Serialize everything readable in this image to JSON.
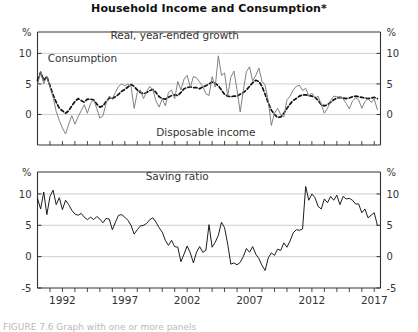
{
  "figure": {
    "title": "Household Income and Consumption*",
    "caption": "FIGURE 7.6 Graph with one or more panels"
  },
  "chart_data": [
    {
      "type": "line",
      "panel": "upper",
      "title": "Real, year-ended growth",
      "xlabel": "",
      "ylabel": "%",
      "ylabel_right": "%",
      "ylim": [
        -5,
        13.5
      ],
      "yticks": [
        0,
        5,
        10
      ],
      "ytick_labels": [
        "0",
        "5",
        "10"
      ],
      "xlim": [
        1990.0,
        2017.5
      ],
      "xticks": [
        1992,
        1997,
        2002,
        2007,
        2012,
        2017
      ],
      "xtick_labels": [
        "1992",
        "1997",
        "2002",
        "2007",
        "2012",
        "2017"
      ],
      "grid": true,
      "legend": "inline-annotations",
      "annotations": [
        {
          "text": "Real, year-ended growth",
          "x": 2001.0,
          "y": 12.3
        },
        {
          "text": "Consumption",
          "x": 1993.6,
          "y": 8.6
        },
        {
          "text": "Disposable income",
          "x": 2003.5,
          "y": -3.6
        }
      ],
      "series": [
        {
          "name": "Consumption",
          "style": "dashed",
          "color": "#111111",
          "x": [
            1990.0,
            1990.25,
            1990.5,
            1990.75,
            1991.0,
            1991.25,
            1991.5,
            1991.75,
            1992.0,
            1992.25,
            1992.5,
            1992.75,
            1993.0,
            1993.25,
            1993.5,
            1993.75,
            1994.0,
            1994.25,
            1994.5,
            1994.75,
            1995.0,
            1995.25,
            1995.5,
            1995.75,
            1996.0,
            1996.25,
            1996.5,
            1996.75,
            1997.0,
            1997.25,
            1997.5,
            1997.75,
            1998.0,
            1998.25,
            1998.5,
            1998.75,
            1999.0,
            1999.25,
            1999.5,
            1999.75,
            2000.0,
            2000.25,
            2000.5,
            2000.75,
            2001.0,
            2001.25,
            2001.5,
            2001.75,
            2002.0,
            2002.25,
            2002.5,
            2002.75,
            2003.0,
            2003.25,
            2003.5,
            2003.75,
            2004.0,
            2004.25,
            2004.5,
            2004.75,
            2005.0,
            2005.25,
            2005.5,
            2005.75,
            2006.0,
            2006.25,
            2006.5,
            2006.75,
            2007.0,
            2007.25,
            2007.5,
            2007.75,
            2008.0,
            2008.25,
            2008.5,
            2008.75,
            2009.0,
            2009.25,
            2009.5,
            2009.75,
            2010.0,
            2010.25,
            2010.5,
            2010.75,
            2011.0,
            2011.25,
            2011.5,
            2011.75,
            2012.0,
            2012.25,
            2012.5,
            2012.75,
            2013.0,
            2013.25,
            2013.5,
            2013.75,
            2014.0,
            2014.25,
            2014.5,
            2014.75,
            2015.0,
            2015.25,
            2015.5,
            2015.75,
            2016.0,
            2016.25,
            2016.5,
            2016.75,
            2017.0,
            2017.25
          ],
          "y": [
            5.6,
            6.9,
            5.6,
            6.2,
            4.7,
            3.2,
            2.0,
            1.0,
            0.6,
            0.2,
            0.6,
            1.4,
            2.1,
            2.6,
            2.3,
            2.0,
            2.5,
            2.5,
            2.4,
            1.7,
            1.2,
            1.4,
            2.1,
            2.7,
            2.6,
            2.9,
            3.3,
            3.8,
            4.1,
            4.5,
            4.9,
            4.6,
            4.0,
            3.6,
            3.4,
            3.6,
            3.9,
            4.1,
            3.6,
            2.9,
            2.6,
            2.5,
            2.8,
            3.1,
            3.2,
            3.1,
            3.6,
            4.2,
            4.4,
            4.5,
            4.4,
            4.4,
            4.2,
            4.5,
            4.7,
            5.0,
            5.3,
            5.1,
            4.7,
            4.0,
            3.3,
            3.0,
            2.9,
            3.0,
            3.0,
            3.3,
            3.6,
            4.0,
            4.6,
            5.2,
            5.6,
            5.4,
            4.6,
            3.3,
            1.9,
            0.7,
            0.0,
            -0.5,
            -0.4,
            0.2,
            1.0,
            1.7,
            2.3,
            2.6,
            3.0,
            3.2,
            3.2,
            3.1,
            3.0,
            2.8,
            2.3,
            1.6,
            1.4,
            1.6,
            2.0,
            2.4,
            2.7,
            2.8,
            2.7,
            2.6,
            2.7,
            2.9,
            3.0,
            2.9,
            2.8,
            2.7,
            2.6,
            2.7,
            2.8,
            2.6
          ]
        },
        {
          "name": "Disposable income",
          "style": "solid",
          "color": "#7a7a7a",
          "x": [
            1990.0,
            1990.25,
            1990.5,
            1990.75,
            1991.0,
            1991.25,
            1991.5,
            1991.75,
            1992.0,
            1992.25,
            1992.5,
            1992.75,
            1993.0,
            1993.25,
            1993.5,
            1993.75,
            1994.0,
            1994.25,
            1994.5,
            1994.75,
            1995.0,
            1995.25,
            1995.5,
            1995.75,
            1996.0,
            1996.25,
            1996.5,
            1996.75,
            1997.0,
            1997.25,
            1997.5,
            1997.75,
            1998.0,
            1998.25,
            1998.5,
            1998.75,
            1999.0,
            1999.25,
            1999.5,
            1999.75,
            2000.0,
            2000.25,
            2000.5,
            2000.75,
            2001.0,
            2001.25,
            2001.5,
            2001.75,
            2002.0,
            2002.25,
            2002.5,
            2002.75,
            2003.0,
            2003.25,
            2003.5,
            2003.75,
            2004.0,
            2004.25,
            2004.5,
            2004.75,
            2005.0,
            2005.25,
            2005.5,
            2005.75,
            2006.0,
            2006.25,
            2006.5,
            2006.75,
            2007.0,
            2007.25,
            2007.5,
            2007.75,
            2008.0,
            2008.25,
            2008.5,
            2008.75,
            2009.0,
            2009.25,
            2009.5,
            2009.75,
            2010.0,
            2010.25,
            2010.5,
            2010.75,
            2011.0,
            2011.25,
            2011.5,
            2011.75,
            2012.0,
            2012.25,
            2012.5,
            2012.75,
            2013.0,
            2013.25,
            2013.5,
            2013.75,
            2014.0,
            2014.25,
            2014.5,
            2014.75,
            2015.0,
            2015.25,
            2015.5,
            2015.75,
            2016.0,
            2016.25,
            2016.5,
            2016.75,
            2017.0,
            2017.25
          ],
          "y": [
            4.8,
            7.1,
            5.0,
            6.3,
            4.4,
            2.8,
            0.5,
            -1.0,
            -2.2,
            -3.2,
            -1.6,
            -0.2,
            -1.6,
            -0.4,
            0.6,
            1.6,
            0.2,
            1.8,
            2.4,
            1.0,
            -0.6,
            -0.2,
            1.8,
            3.0,
            2.6,
            3.6,
            4.6,
            5.0,
            4.7,
            5.0,
            4.6,
            1.0,
            3.6,
            4.0,
            2.6,
            3.8,
            4.6,
            4.0,
            2.2,
            1.2,
            2.6,
            1.4,
            3.6,
            4.0,
            2.6,
            5.4,
            4.0,
            5.8,
            6.4,
            4.4,
            6.2,
            6.0,
            5.3,
            4.6,
            3.4,
            3.1,
            6.2,
            4.5,
            9.6,
            6.4,
            6.8,
            3.0,
            6.1,
            7.1,
            4.0,
            0.4,
            3.9,
            7.0,
            7.8,
            5.5,
            6.4,
            7.6,
            5.4,
            4.8,
            2.2,
            -1.8,
            0.2,
            1.0,
            0.0,
            -0.4,
            2.4,
            3.0,
            4.0,
            4.6,
            4.8,
            3.9,
            4.3,
            3.0,
            3.5,
            2.6,
            3.0,
            1.6,
            0.2,
            1.0,
            2.3,
            3.0,
            2.9,
            2.8,
            2.6,
            1.8,
            0.9,
            2.2,
            2.7,
            2.4,
            1.0,
            2.1,
            2.6,
            2.0,
            2.5,
            0.8
          ]
        }
      ]
    },
    {
      "type": "line",
      "panel": "lower",
      "title": "Saving ratio",
      "xlabel": "",
      "ylabel": "%",
      "ylabel_right": "%",
      "ylim": [
        -5,
        13.5
      ],
      "yticks": [
        -5,
        0,
        5,
        10
      ],
      "ytick_labels": [
        "-5",
        "0",
        "5",
        "10"
      ],
      "xlim": [
        1990.0,
        2017.5
      ],
      "xticks": [
        1992,
        1997,
        2002,
        2007,
        2012,
        2017
      ],
      "xtick_labels": [
        "1992",
        "1997",
        "2002",
        "2007",
        "2012",
        "2017"
      ],
      "grid": true,
      "annotations": [
        {
          "text": "Saving ratio",
          "x": 2001.2,
          "y": 12.3
        }
      ],
      "series": [
        {
          "name": "Saving ratio",
          "style": "solid",
          "color": "#111111",
          "x": [
            1990.0,
            1990.25,
            1990.5,
            1990.75,
            1991.0,
            1991.25,
            1991.5,
            1991.75,
            1992.0,
            1992.25,
            1992.5,
            1992.75,
            1993.0,
            1993.25,
            1993.5,
            1993.75,
            1994.0,
            1994.25,
            1994.5,
            1994.75,
            1995.0,
            1995.25,
            1995.5,
            1995.75,
            1996.0,
            1996.25,
            1996.5,
            1996.75,
            1997.0,
            1997.25,
            1997.5,
            1997.75,
            1998.0,
            1998.25,
            1998.5,
            1998.75,
            1999.0,
            1999.25,
            1999.5,
            1999.75,
            2000.0,
            2000.25,
            2000.5,
            2000.75,
            2001.0,
            2001.25,
            2001.5,
            2001.75,
            2002.0,
            2002.25,
            2002.5,
            2002.75,
            2003.0,
            2003.25,
            2003.5,
            2003.75,
            2004.0,
            2004.25,
            2004.5,
            2004.75,
            2005.0,
            2005.25,
            2005.5,
            2005.75,
            2006.0,
            2006.25,
            2006.5,
            2006.75,
            2007.0,
            2007.25,
            2007.5,
            2007.75,
            2008.0,
            2008.25,
            2008.5,
            2008.75,
            2009.0,
            2009.25,
            2009.5,
            2009.75,
            2010.0,
            2010.25,
            2010.5,
            2010.75,
            2011.0,
            2011.25,
            2011.5,
            2011.75,
            2012.0,
            2012.25,
            2012.5,
            2012.75,
            2013.0,
            2013.25,
            2013.5,
            2013.75,
            2014.0,
            2014.25,
            2014.5,
            2014.75,
            2015.0,
            2015.25,
            2015.5,
            2015.75,
            2016.0,
            2016.25,
            2016.5,
            2016.75,
            2017.0,
            2017.25
          ],
          "y": [
            9.3,
            7.6,
            10.3,
            6.7,
            9.6,
            10.6,
            8.3,
            9.4,
            7.5,
            9.0,
            8.3,
            7.4,
            6.8,
            6.6,
            6.9,
            6.3,
            5.9,
            6.3,
            5.9,
            6.4,
            6.0,
            5.4,
            6.1,
            6.0,
            4.3,
            5.5,
            6.6,
            6.7,
            6.3,
            5.8,
            5.0,
            3.6,
            4.3,
            4.9,
            5.0,
            5.3,
            5.9,
            6.2,
            5.5,
            4.6,
            3.9,
            2.6,
            1.8,
            2.6,
            1.6,
            1.5,
            -0.8,
            0.4,
            1.7,
            0.6,
            -1.0,
            0.7,
            1.6,
            0.7,
            1.0,
            5.1,
            1.5,
            2.3,
            3.4,
            5.5,
            4.6,
            2.0,
            -1.2,
            -1.0,
            -1.3,
            -0.9,
            0.0,
            1.3,
            0.7,
            1.6,
            0.4,
            -0.3,
            -1.4,
            -2.2,
            -0.2,
            0.6,
            0.2,
            1.2,
            1.0,
            2.2,
            1.5,
            2.5,
            3.8,
            4.3,
            4.2,
            4.4,
            11.2,
            9.0,
            10.0,
            9.4,
            8.0,
            7.6,
            9.2,
            8.6,
            9.6,
            9.0,
            9.8,
            8.3,
            9.6,
            9.2,
            9.3,
            9.0,
            8.4,
            8.4,
            7.0,
            7.6,
            6.2,
            6.6,
            7.0,
            5.0
          ]
        }
      ]
    }
  ]
}
